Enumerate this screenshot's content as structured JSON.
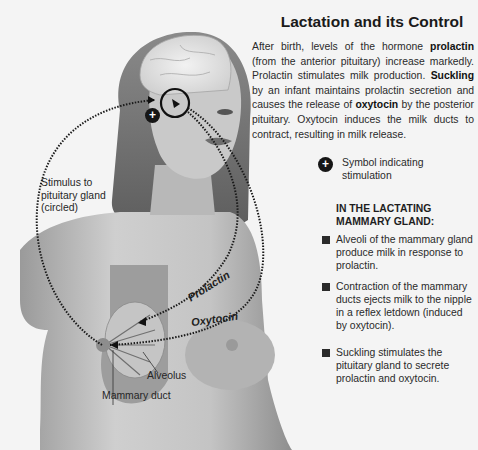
{
  "title": "Lactation and its Control",
  "intro": {
    "p1": "After birth, levels of the hormone ",
    "b1": "prolactin",
    "p2": " (from the anterior pituitary) increase markedly. Prolactin stimulates milk production. ",
    "b2": "Suckling",
    "p3": " by an infant maintains prolactin secretion and causes the release of ",
    "b3": "oxytocin",
    "p4": " by the posterior pituitary. Oxytocin induces the milk ducts to contract, resulting in milk release."
  },
  "legend": {
    "symbol": "+",
    "text": "Symbol indicating stimulation"
  },
  "subheading": {
    "line1": "IN THE LACTATING",
    "line2": "MAMMARY GLAND:"
  },
  "bullets": [
    {
      "text": "Alveoli of the mammary gland produce milk in response to prolactin."
    },
    {
      "text": "Contraction of the mammary ducts ejects milk to the nipple in a reflex letdown (induced by oxytocin)."
    },
    {
      "text": "Suckling stimulates the pituitary gland to secrete prolactin and oxytocin."
    }
  ],
  "labels": {
    "stimulus": {
      "l1": "Stimulus to",
      "l2": "pituitary gland",
      "l3": "(circled)"
    },
    "prolactin": "Prolactin",
    "oxytocin": "Oxytocin",
    "alveolus": "Alveolus",
    "mammary_duct": "Mammary duct"
  },
  "colors": {
    "background": "#f4f4f4",
    "text": "#2a2a2a",
    "dotted_path": "#1a1a1a"
  }
}
